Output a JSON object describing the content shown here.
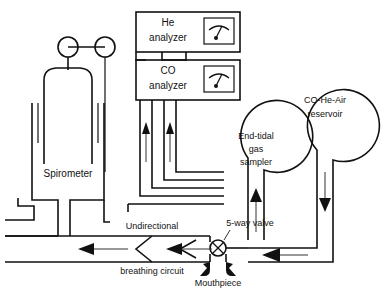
{
  "figure": {
    "background_color": "#ffffff",
    "line_color": "#111111"
  },
  "components": {
    "spirometer": {
      "label": "Spirometer",
      "pulley_left": "pulley-left",
      "pulley_right": "pulley-right"
    },
    "he_analyzer": {
      "line1": "He",
      "line2": "analyzer",
      "gauge": "gauge-dial"
    },
    "co_analyzer": {
      "line1": "CO",
      "line2": "analyzer",
      "gauge": "gauge-dial"
    },
    "end_tidal_sampler": {
      "line1": "End-tidal",
      "line2": "gas",
      "line3": "sampler"
    },
    "reservoir": {
      "line1": "CO-He-Air",
      "line2": "reservoir"
    },
    "valve": {
      "label": "5-way valve"
    },
    "mouthpiece": {
      "label": "Mouthpiece"
    },
    "breathing_circuit": {
      "line1": "Undirectional",
      "line2": "breathing circuit"
    }
  },
  "flow_arrows": [
    {
      "name": "sampler-inlet-up",
      "direction": "up"
    },
    {
      "name": "co-analyzer-feed-up",
      "direction": "up"
    },
    {
      "name": "he-analyzer-feed-up",
      "direction": "up"
    },
    {
      "name": "reservoir-outlet-down",
      "direction": "down"
    },
    {
      "name": "circuit-inspiratory-left",
      "direction": "left"
    },
    {
      "name": "circuit-expiratory-left",
      "direction": "left"
    },
    {
      "name": "valve-return-left",
      "direction": "left"
    }
  ]
}
